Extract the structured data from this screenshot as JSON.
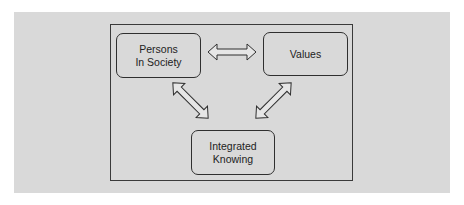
{
  "diagram": {
    "nodes": {
      "persons_in_society": {
        "line1": "Persons",
        "line2": "In Society"
      },
      "values": {
        "label": "Values"
      },
      "integrated_knowing": {
        "line1": "Integrated",
        "line2": "Knowing"
      }
    },
    "edges": [
      {
        "from": "Persons In Society",
        "to": "Values",
        "type": "bidirectional"
      },
      {
        "from": "Persons In Society",
        "to": "Integrated Knowing",
        "type": "bidirectional"
      },
      {
        "from": "Values",
        "to": "Integrated Knowing",
        "type": "bidirectional"
      }
    ],
    "colors": {
      "panel_background": "#d9d9d9",
      "border": "#2f2f2f",
      "arrow_fill": "#e6e6e6"
    }
  }
}
